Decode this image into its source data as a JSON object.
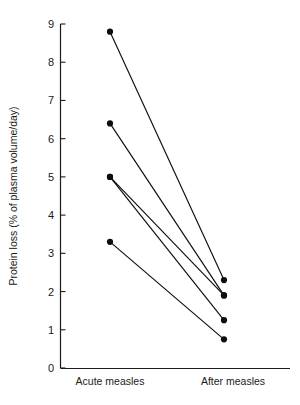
{
  "chart_data": {
    "type": "line",
    "title": "",
    "subtitle": "",
    "xlabel": "",
    "ylabel": "Protein loss (% of plasma volume/day)",
    "categories": [
      "Acute measles",
      "After measles"
    ],
    "x_tick_labels": [
      "Acute measles",
      "After measles"
    ],
    "y_tick_labels": [
      "0",
      "1",
      "2",
      "3",
      "4",
      "5",
      "6",
      "7",
      "8",
      "9"
    ],
    "y_ticks": [
      0,
      1,
      2,
      3,
      4,
      5,
      6,
      7,
      8,
      9
    ],
    "ylim": [
      0,
      9
    ],
    "xlim": [
      0,
      1
    ],
    "grid": false,
    "legend": false,
    "legend_position": "none",
    "marker": "filled-circle",
    "series": [
      {
        "name": "subject-1",
        "values": [
          8.8,
          2.3
        ]
      },
      {
        "name": "subject-2",
        "values": [
          6.4,
          1.9
        ]
      },
      {
        "name": "subject-3",
        "values": [
          5.0,
          1.9
        ]
      },
      {
        "name": "subject-4",
        "values": [
          5.0,
          1.25
        ]
      },
      {
        "name": "subject-5",
        "values": [
          3.3,
          0.75
        ]
      }
    ],
    "annotations": []
  },
  "colors": {
    "line": "#0d0d0d",
    "marker": "#0d0d0d",
    "axis": "#1a1a1a",
    "background": "#ffffff"
  }
}
